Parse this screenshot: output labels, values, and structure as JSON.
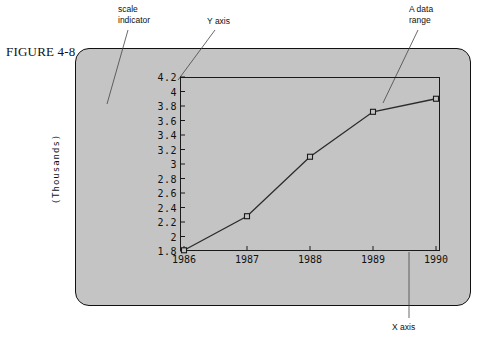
{
  "figure": {
    "caption": "FIGURE 4-8"
  },
  "annotations": {
    "scale_indicator": "scale\nindicator",
    "y_axis": "Y axis",
    "data_range": "A data\nrange",
    "x_axis": "X axis"
  },
  "colors": {
    "panel_fill": "#c4c4c4",
    "panel_border": "#111111",
    "plot_border": "#1a1a1a",
    "line": "#2b2b2b",
    "marker_fill": "#c4c4c4",
    "marker_stroke": "#1a1a1a",
    "text": "#111111",
    "page_background": "#ffffff"
  },
  "chart_data": {
    "type": "line",
    "title": "",
    "xlabel": "",
    "ylabel": "(Thousands)",
    "categories": [
      "1986",
      "1987",
      "1988",
      "1989",
      "1990"
    ],
    "values": [
      1.81,
      2.28,
      3.1,
      3.72,
      3.9
    ],
    "series": [
      {
        "name": "",
        "values": [
          1.81,
          2.28,
          3.1,
          3.72,
          3.9
        ]
      }
    ],
    "ylim": [
      1.8,
      4.2
    ],
    "ytick_labels": [
      "4.2",
      "4",
      "3.8",
      "3.6",
      "3.4",
      "3.2",
      "3",
      "2.8",
      "2.6",
      "2.4",
      "2.2",
      "2",
      "1.8"
    ],
    "ytick_values": [
      4.2,
      4.0,
      3.8,
      3.6,
      3.4,
      3.2,
      3.0,
      2.8,
      2.6,
      2.4,
      2.2,
      2.0,
      1.8
    ],
    "xtick_labels": [
      "1986",
      "1987",
      "1988",
      "1989",
      "1990"
    ],
    "grid": false,
    "legend": "none",
    "markers": "open-square"
  }
}
